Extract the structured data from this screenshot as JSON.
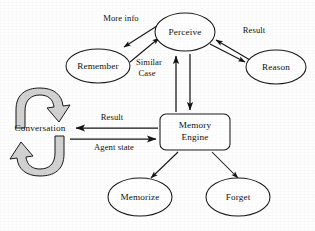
{
  "diagram": {
    "type": "flow-diagram",
    "background_color": "#fefefe",
    "stroke_color": "#141414",
    "block_arrow_fill": "#d2d2d2",
    "nodes": [
      {
        "id": "perceive",
        "label": "Perceive",
        "shape": "ellipse",
        "cx": 185,
        "cy": 32,
        "rx": 30,
        "ry": 19
      },
      {
        "id": "remember",
        "label": "Remember",
        "shape": "ellipse",
        "cx": 98,
        "cy": 66,
        "rx": 32,
        "ry": 17
      },
      {
        "id": "reason",
        "label": "Reason",
        "shape": "ellipse",
        "cx": 276,
        "cy": 67,
        "rx": 30,
        "ry": 17
      },
      {
        "id": "memory-engine",
        "label": "Memory",
        "label2": "Engine",
        "shape": "rounded-rect",
        "x": 160,
        "y": 114,
        "w": 70,
        "h": 36
      },
      {
        "id": "memorize",
        "label": "Memorize",
        "shape": "ellipse",
        "cx": 140,
        "cy": 197,
        "rx": 32,
        "ry": 19
      },
      {
        "id": "forget",
        "label": "Forget",
        "shape": "ellipse",
        "cx": 238,
        "cy": 197,
        "rx": 32,
        "ry": 19
      },
      {
        "id": "conversation",
        "label": "Conversation",
        "shape": "cycle-arrows",
        "cx": 40,
        "cy": 128
      }
    ],
    "edge_labels": [
      {
        "id": "more-info",
        "text": "More info",
        "x": 121,
        "y": 19
      },
      {
        "id": "similar-case",
        "text": "Similar",
        "x": 148,
        "y": 63
      },
      {
        "id": "similar-case2",
        "text": "Case",
        "x": 147,
        "y": 74
      },
      {
        "id": "result-top",
        "text": "Result",
        "x": 254,
        "y": 31
      },
      {
        "id": "result-mid",
        "text": "Result",
        "x": 110,
        "y": 118
      },
      {
        "id": "agent-state",
        "text": "Agent state",
        "x": 112,
        "y": 147
      }
    ],
    "edges": [
      {
        "id": "perceive-to-remember",
        "from": "perceive",
        "to": "remember",
        "label": "More info",
        "direction": "down-left"
      },
      {
        "id": "remember-to-perceive",
        "from": "remember",
        "to": "perceive",
        "label": "Similar Case",
        "direction": "up-right"
      },
      {
        "id": "reason-to-perceive",
        "from": "reason",
        "to": "perceive",
        "label": "Result",
        "direction": "up-left"
      },
      {
        "id": "perceive-to-reason",
        "from": "perceive",
        "to": "reason",
        "label": "",
        "direction": "down-right"
      },
      {
        "id": "engine-to-perceive",
        "from": "memory-engine",
        "to": "perceive",
        "label": "",
        "direction": "up"
      },
      {
        "id": "perceive-to-engine",
        "from": "perceive",
        "to": "memory-engine",
        "label": "",
        "direction": "down"
      },
      {
        "id": "engine-to-conversation",
        "from": "memory-engine",
        "to": "conversation",
        "label": "Result",
        "direction": "left"
      },
      {
        "id": "conversation-to-engine",
        "from": "conversation",
        "to": "memory-engine",
        "label": "Agent state",
        "direction": "right"
      },
      {
        "id": "engine-to-memorize",
        "from": "memory-engine",
        "to": "memorize",
        "label": "",
        "direction": "down-left"
      },
      {
        "id": "engine-to-forget",
        "from": "memory-engine",
        "to": "forget",
        "label": "",
        "direction": "down-right"
      }
    ]
  }
}
